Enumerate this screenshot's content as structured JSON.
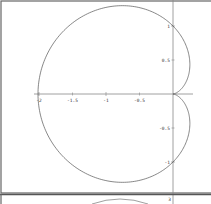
{
  "chart_data": [
    {
      "type": "line",
      "title": "",
      "description": "Cardioid polar curve r = 1 - cos(theta)",
      "xlabel": "",
      "ylabel": "",
      "xlim": [
        -2.0,
        0.3
      ],
      "ylim": [
        -1.3,
        1.3
      ],
      "x_ticks": [
        -2,
        -1.5,
        -1,
        -0.5
      ],
      "x_tick_labels": [
        "-2",
        "-1.5",
        "-1",
        "-0.5"
      ],
      "y_ticks": [
        1,
        0.5,
        -0.5,
        -1
      ],
      "y_tick_labels": [
        "1",
        "0.5",
        "-0.5",
        "-1"
      ],
      "grid": false,
      "series": [
        {
          "name": "cardioid",
          "x": [
            0,
            -0.75,
            -2,
            -0.75,
            0
          ],
          "y": [
            0,
            1.299,
            0,
            -1.299,
            0
          ]
        }
      ]
    },
    {
      "type": "line",
      "title": "",
      "description": "Second plot panel (mostly cropped)",
      "y_tick_labels": [
        "3"
      ]
    }
  ],
  "panel1": {
    "x_labels": [
      "-2",
      "-1.5",
      "-1",
      "-0.5"
    ],
    "y_labels": [
      "1",
      "0.5",
      "-0.5",
      "-1"
    ]
  },
  "panel2": {
    "y_label_top": "3"
  },
  "colors": {
    "curve": "#555555",
    "axis": "#777777",
    "border": "#555555"
  }
}
